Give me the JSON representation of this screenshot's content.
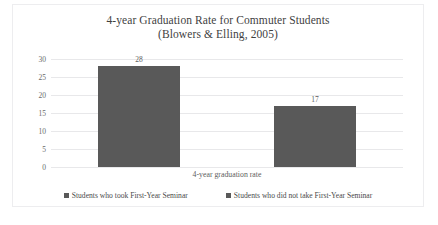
{
  "chart_data": {
    "type": "bar",
    "title": "4-year Graduation Rate for Commuter Students (Blowers & Elling, 2005)",
    "title_lines": [
      "4-year Graduation Rate for Commuter Students",
      "(Blowers & Elling, 2005)"
    ],
    "categories": [
      "4-year graduation rate"
    ],
    "xlabel": "4-year graduation rate",
    "ylabel": "",
    "ylim": [
      0,
      30
    ],
    "yticks": [
      30,
      25,
      20,
      15,
      10,
      5,
      0
    ],
    "grid": true,
    "legend_position": "bottom",
    "series": [
      {
        "name": "Students who took First-Year Seminar",
        "values": [
          28
        ],
        "data_labels": [
          "28"
        ],
        "color": "#595959"
      },
      {
        "name": "Students who did not take First-Year Seminar",
        "values": [
          17
        ],
        "data_labels": [
          "17"
        ],
        "color": "#595959"
      }
    ]
  },
  "colors": {
    "bar": "#595959",
    "gridline": "#e8e8ea",
    "border": "#ededef",
    "title_text": "#3f3f3f",
    "tick_text": "#6a6a6a",
    "background": "#ffffff"
  }
}
